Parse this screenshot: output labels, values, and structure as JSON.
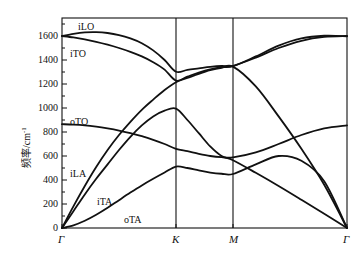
{
  "axes": {
    "y_label_text": "频率/cm",
    "y_label_sup": "-1",
    "y_ticks": [
      0,
      200,
      400,
      600,
      800,
      1000,
      1200,
      1400,
      1600
    ],
    "y_min": 0,
    "y_max": 1750,
    "x_ticks": [
      "Γ",
      "K",
      "M",
      "Γ"
    ],
    "x_tick_positions": [
      0,
      1,
      1.5,
      2.5
    ],
    "grid": "vertical-only",
    "frame": "box"
  },
  "branch_labels": [
    {
      "name": "iLO",
      "x": 78,
      "y": 22
    },
    {
      "name": "iTO",
      "x": 70,
      "y": 49
    },
    {
      "name": "oTO",
      "x": 70,
      "y": 117
    },
    {
      "name": "iLA",
      "x": 70,
      "y": 169
    },
    {
      "name": "iTA",
      "x": 97,
      "y": 197
    },
    {
      "name": "oTA",
      "x": 124,
      "y": 215
    }
  ],
  "chart_data": {
    "type": "line",
    "title": "",
    "xlabel": "",
    "ylabel": "频率/cm-1",
    "ylim": [
      0,
      1750
    ],
    "xlim": [
      0,
      2.5
    ],
    "x_tick_labels": [
      "Γ",
      "K",
      "M",
      "Γ"
    ],
    "x_tick_values": [
      0,
      1,
      1.5,
      2.5
    ],
    "legend": "inline-annotations",
    "grid": false,
    "line_color": "#111111",
    "series": [
      {
        "name": "iLO",
        "x": [
          0,
          0.1,
          0.2,
          0.3,
          0.4,
          0.5,
          0.6,
          0.7,
          0.8,
          0.9,
          1.0,
          1.1,
          1.2,
          1.3,
          1.4,
          1.5,
          1.7,
          1.9,
          2.1,
          2.3,
          2.5
        ],
        "y": [
          1600,
          1618,
          1630,
          1632,
          1625,
          1608,
          1580,
          1540,
          1480,
          1400,
          1302,
          1318,
          1330,
          1342,
          1350,
          1352,
          1420,
          1500,
          1560,
          1592,
          1600
        ]
      },
      {
        "name": "iTO",
        "x": [
          0,
          0.1,
          0.2,
          0.3,
          0.4,
          0.5,
          0.6,
          0.7,
          0.8,
          0.9,
          1.0,
          1.1,
          1.2,
          1.3,
          1.4,
          1.5,
          1.7,
          1.9,
          2.1,
          2.3,
          2.5
        ],
        "y": [
          1600,
          1588,
          1572,
          1552,
          1528,
          1500,
          1468,
          1430,
          1382,
          1320,
          1228,
          1262,
          1295,
          1322,
          1340,
          1348,
          1430,
          1520,
          1580,
          1602,
          1598
        ]
      },
      {
        "name": "oTO",
        "x": [
          0,
          0.1,
          0.2,
          0.3,
          0.4,
          0.5,
          0.6,
          0.7,
          0.8,
          0.9,
          1.0,
          1.1,
          1.2,
          1.3,
          1.4,
          1.5,
          1.7,
          1.9,
          2.1,
          2.3,
          2.5
        ],
        "y": [
          865,
          862,
          856,
          845,
          830,
          812,
          790,
          765,
          735,
          700,
          660,
          640,
          618,
          600,
          590,
          588,
          630,
          700,
          775,
          830,
          855
        ]
      },
      {
        "name": "iLA",
        "x": [
          0,
          0.1,
          0.2,
          0.3,
          0.4,
          0.5,
          0.6,
          0.7,
          0.8,
          0.9,
          1.0,
          1.1,
          1.2,
          1.3,
          1.4,
          1.5,
          1.7,
          1.9,
          2.1,
          2.3,
          2.5
        ],
        "y": [
          0,
          180,
          350,
          508,
          650,
          775,
          885,
          985,
          1070,
          1150,
          1215,
          1250,
          1285,
          1315,
          1335,
          1345,
          1180,
          930,
          660,
          360,
          0
        ]
      },
      {
        "name": "iTA",
        "x": [
          0,
          0.1,
          0.2,
          0.3,
          0.4,
          0.5,
          0.6,
          0.7,
          0.8,
          0.9,
          1.0,
          1.1,
          1.2,
          1.3,
          1.4,
          1.5,
          1.7,
          1.9,
          2.1,
          2.3,
          2.5
        ],
        "y": [
          0,
          140,
          280,
          410,
          530,
          650,
          760,
          855,
          930,
          978,
          995,
          900,
          790,
          680,
          600,
          565,
          460,
          350,
          235,
          118,
          0
        ]
      },
      {
        "name": "oTA",
        "x": [
          0,
          0.1,
          0.2,
          0.3,
          0.4,
          0.5,
          0.6,
          0.7,
          0.8,
          0.9,
          1.0,
          1.1,
          1.2,
          1.3,
          1.4,
          1.5,
          1.7,
          1.9,
          2.1,
          2.3,
          2.5
        ],
        "y": [
          0,
          22,
          60,
          110,
          168,
          232,
          295,
          355,
          410,
          462,
          512,
          500,
          480,
          462,
          452,
          450,
          530,
          600,
          560,
          390,
          0
        ]
      }
    ]
  }
}
